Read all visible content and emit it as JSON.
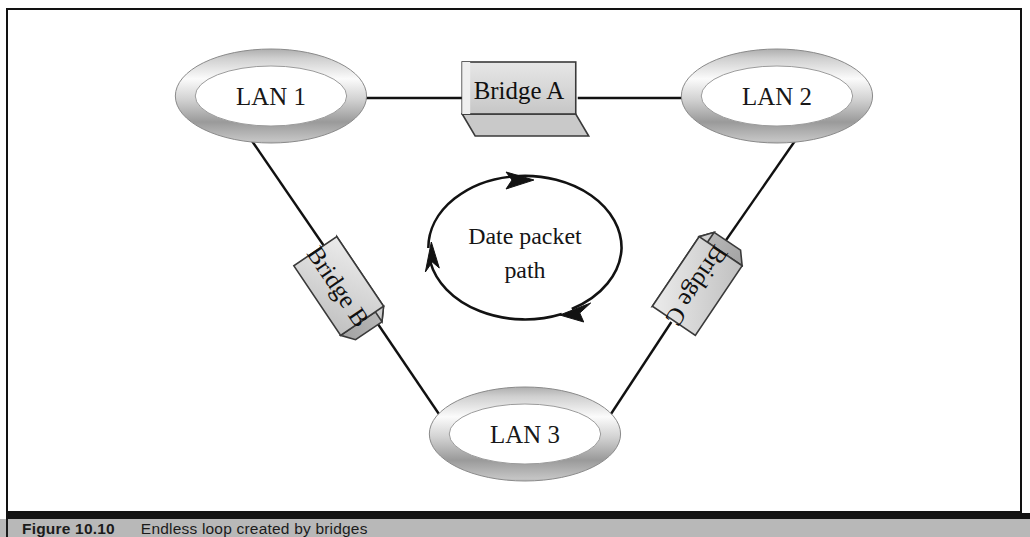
{
  "figure": {
    "title": "Endless loop created by bridges",
    "border_color": "#121212",
    "background_color": "#ffffff"
  },
  "caption": {
    "number": "Figure 10.10",
    "description": "Endless loop created by bridges",
    "band_color": "#b8b8b8",
    "rule_color": "#141414"
  },
  "nodes": {
    "lan1": {
      "label": "LAN 1",
      "cx": 264,
      "cy": 86,
      "rx": 96,
      "ry": 47
    },
    "lan2": {
      "label": "LAN 2",
      "cx": 772,
      "cy": 86,
      "rx": 96,
      "ry": 47
    },
    "lan3": {
      "label": "LAN 3",
      "cx": 519,
      "cy": 424,
      "rx": 96,
      "ry": 47
    }
  },
  "bridges": {
    "bridge_a": {
      "label": "Bridge A",
      "orientation": "horizontal",
      "x": 462,
      "y": 58
    },
    "bridge_b": {
      "label": "Bridge B",
      "orientation": "rotated-down-right",
      "x": 300,
      "y": 240
    },
    "bridge_c": {
      "label": "Bridge C",
      "orientation": "rotated-down-left",
      "x": 700,
      "y": 240
    }
  },
  "loop": {
    "line1": "Date packet",
    "line2": "path",
    "direction": "clockwise",
    "arrow_count": 3,
    "cx": 519,
    "cy": 238,
    "rx": 97,
    "ry": 72
  },
  "links": [
    {
      "from": "LAN 1",
      "to": "Bridge A"
    },
    {
      "from": "Bridge A",
      "to": "LAN 2"
    },
    {
      "from": "LAN 1",
      "to": "Bridge B"
    },
    {
      "from": "Bridge B",
      "to": "LAN 3"
    },
    {
      "from": "LAN 2",
      "to": "Bridge C"
    },
    {
      "from": "Bridge C",
      "to": "LAN 3"
    }
  ],
  "colors": {
    "ring_light": "#fdfdfd",
    "ring_mid": "#b4b4b4",
    "ring_dark": "#6d6d6d",
    "box_face": "#d8d8d8",
    "box_side": "#b0b0b0",
    "box_bottom": "#c2c2c2",
    "line": "#111111"
  }
}
